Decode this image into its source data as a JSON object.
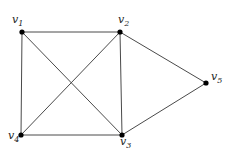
{
  "figure": {
    "type": "undirected-graph-diagram",
    "width": 230,
    "height": 152,
    "background_color": "#ffffff",
    "edge_color": "#4a4a4a",
    "vertex_color": "#000000",
    "label_color": "#1a1a1a"
  },
  "vertices": [
    {
      "id": "v1",
      "letter": "v",
      "subscript": "1",
      "label": "v1",
      "x": 22,
      "y": 32,
      "label_x": 12,
      "label_y": 14,
      "degree": 3
    },
    {
      "id": "v2",
      "letter": "v",
      "subscript": "2",
      "label": "v2",
      "x": 120,
      "y": 32,
      "label_x": 118,
      "label_y": 14,
      "degree": 4
    },
    {
      "id": "v3",
      "letter": "v",
      "subscript": "3",
      "label": "v3",
      "x": 122,
      "y": 135,
      "label_x": 120,
      "label_y": 136,
      "degree": 4
    },
    {
      "id": "v4",
      "letter": "v",
      "subscript": "4",
      "label": "v4",
      "x": 21,
      "y": 135,
      "label_x": 8,
      "label_y": 130,
      "degree": 3
    },
    {
      "id": "v5",
      "letter": "v",
      "subscript": "5",
      "label": "v5",
      "x": 206,
      "y": 83,
      "label_x": 211,
      "label_y": 71,
      "degree": 2
    }
  ],
  "edges": [
    {
      "id": "e-v1-v2",
      "from": "v1",
      "to": "v2",
      "x1": 22,
      "y1": 32,
      "x2": 120,
      "y2": 32
    },
    {
      "id": "e-v1-v4",
      "from": "v1",
      "to": "v4",
      "x1": 22,
      "y1": 32,
      "x2": 21,
      "y2": 135
    },
    {
      "id": "e-v1-v3",
      "from": "v1",
      "to": "v3",
      "x1": 22,
      "y1": 32,
      "x2": 122,
      "y2": 135
    },
    {
      "id": "e-v2-v4",
      "from": "v2",
      "to": "v4",
      "x1": 120,
      "y1": 32,
      "x2": 21,
      "y2": 135
    },
    {
      "id": "e-v2-v3",
      "from": "v2",
      "to": "v3",
      "x1": 120,
      "y1": 32,
      "x2": 122,
      "y2": 135
    },
    {
      "id": "e-v2-v5",
      "from": "v2",
      "to": "v5",
      "x1": 120,
      "y1": 32,
      "x2": 206,
      "y2": 83
    },
    {
      "id": "e-v4-v3",
      "from": "v4",
      "to": "v3",
      "x1": 21,
      "y1": 135,
      "x2": 122,
      "y2": 135
    },
    {
      "id": "e-v3-v5",
      "from": "v3",
      "to": "v5",
      "x1": 122,
      "y1": 135,
      "x2": 206,
      "y2": 83
    }
  ]
}
